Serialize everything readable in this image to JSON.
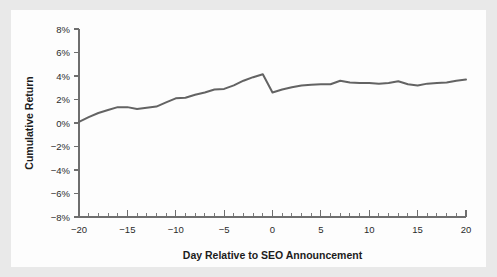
{
  "figure": {
    "background_color": "#e9e9e9",
    "card_color": "#fdfdfd"
  },
  "chart_data": {
    "type": "line",
    "title": "",
    "subtitle": "",
    "xlabel": "Day Relative to SEO Announcement",
    "ylabel": "Cumulative Return",
    "xlim": [
      -20,
      20
    ],
    "ylim": [
      -8,
      8
    ],
    "grid": false,
    "legend": "none",
    "line_color": "#636363",
    "axis_color": "#6e6e6e",
    "x_tick_labels": [
      "−20",
      "−15",
      "−10",
      "−5",
      "0",
      "5",
      "10",
      "15",
      "20"
    ],
    "x_tick_values": [
      -20,
      -15,
      -10,
      -5,
      0,
      5,
      10,
      15,
      20
    ],
    "x_minor_step": 1,
    "y_tick_labels": [
      "8%",
      "6%",
      "4%",
      "2%",
      "0%",
      "−2%",
      "−4%",
      "−6%",
      "−8%"
    ],
    "y_tick_values": [
      8,
      6,
      4,
      2,
      0,
      -2,
      -4,
      -6,
      -8
    ],
    "series": [
      {
        "name": "Cumulative Return",
        "x": [
          -20,
          -19,
          -18,
          -17,
          -16,
          -15,
          -14,
          -13,
          -12,
          -11,
          -10,
          -9,
          -8,
          -7,
          -6,
          -5,
          -4,
          -3,
          -2,
          -1,
          0,
          1,
          2,
          3,
          4,
          5,
          6,
          7,
          8,
          9,
          10,
          11,
          12,
          13,
          14,
          15,
          16,
          17,
          18,
          19,
          20
        ],
        "values": [
          0.1,
          0.5,
          0.85,
          1.1,
          1.35,
          1.35,
          1.2,
          1.3,
          1.4,
          1.75,
          2.1,
          2.15,
          2.4,
          2.6,
          2.85,
          2.9,
          3.2,
          3.6,
          3.9,
          4.15,
          2.6,
          2.85,
          3.05,
          3.2,
          3.25,
          3.3,
          3.3,
          3.6,
          3.45,
          3.4,
          3.4,
          3.35,
          3.4,
          3.55,
          3.3,
          3.2,
          3.35,
          3.4,
          3.45,
          3.6,
          3.7
        ]
      }
    ],
    "annotations": []
  }
}
